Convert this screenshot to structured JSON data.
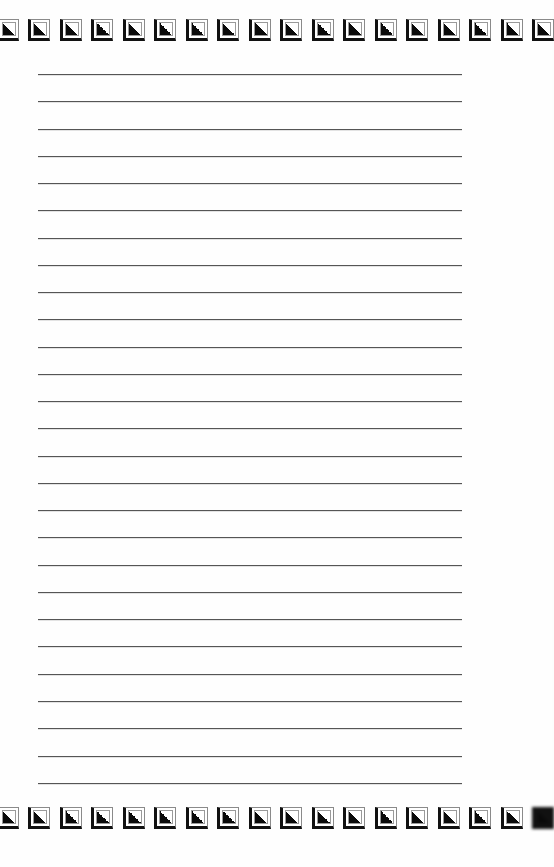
{
  "page": {
    "type": "lined-writing-paper",
    "background_color": "#fefefe",
    "rule_color": "#555555",
    "rule_count": 27,
    "rule_start_y": 74,
    "rule_spacing": 27.26,
    "rule_left": 38,
    "rule_right": 462
  },
  "border": {
    "icon": "corner-triangle-square-icon",
    "tile_spacing": 31.5,
    "first_tile_x": -3.5,
    "top_row": {
      "tile_count": 18,
      "y": 19
    },
    "bottom_row": {
      "tile_count": 18,
      "y": 807,
      "last_tile_blurred": true
    },
    "colors": {
      "frame": "#111111",
      "inner_border": "#9a9a9a",
      "triangle": "#0a0a0a"
    }
  }
}
